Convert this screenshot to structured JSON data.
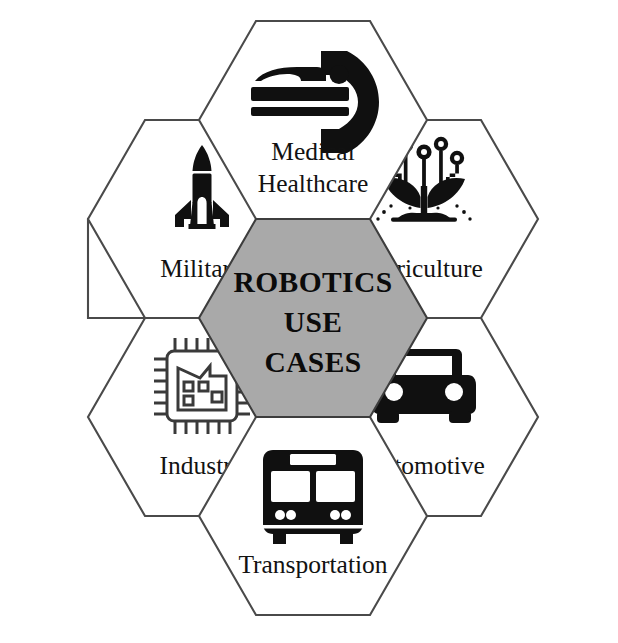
{
  "diagram": {
    "layout": "honeycomb",
    "background_color": "#ffffff",
    "center": {
      "name": "center-hexagon",
      "fill_color": "#a9a9a9",
      "stroke_color": "#3d3d3d",
      "lines": [
        "ROBOTICS",
        "USE",
        "CASES"
      ],
      "line1": "ROBOTICS",
      "line2": "USE",
      "line3": "CASES"
    },
    "spokes": [
      {
        "id": "medical-healthcare",
        "position": "top",
        "icon": "mri-scanner-icon",
        "label_lines": [
          "Medical",
          "Healthcare"
        ],
        "line1": "Medical",
        "line2": "Healthcare"
      },
      {
        "id": "agriculture",
        "position": "upper-right",
        "icon": "smart-plant-sprout-icon",
        "label_lines": [
          "Agriculture"
        ],
        "line1": "Agriculture",
        "line2": ""
      },
      {
        "id": "automotive",
        "position": "lower-right",
        "icon": "car-front-icon",
        "label_lines": [
          "Automotive"
        ],
        "line1": "Automotive",
        "line2": ""
      },
      {
        "id": "transportation",
        "position": "bottom",
        "icon": "bus-front-icon",
        "label_lines": [
          "Transportation"
        ],
        "line1": "Transportation",
        "line2": ""
      },
      {
        "id": "industry",
        "position": "lower-left",
        "icon": "factory-microchip-icon",
        "label_lines": [
          "Industry"
        ],
        "line1": "Industry",
        "line2": ""
      },
      {
        "id": "military",
        "position": "upper-left",
        "icon": "missile-rocket-icon",
        "label_lines": [
          "Military"
        ],
        "line1": "Military",
        "line2": ""
      }
    ],
    "colors": {
      "hex_stroke": "#4a4a4a",
      "center_fill": "#a9a9a9",
      "icon_fill": "#101010",
      "text": "#121212"
    }
  }
}
